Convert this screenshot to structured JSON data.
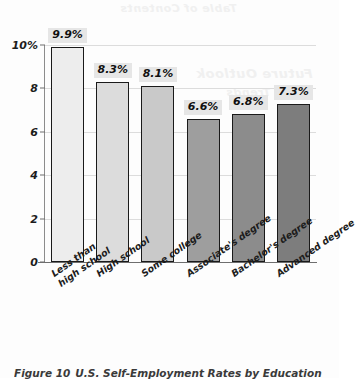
{
  "figure": {
    "caption_label": "Figure 10",
    "caption_text": "U.S. Self-Employment Rates by Education",
    "bleed_through_top": "Table of Contents",
    "bleed_through_mid": "Future Outlook",
    "bleed_through_mid2": "and Trends"
  },
  "chart_data": {
    "type": "bar",
    "title": "",
    "xlabel": "",
    "ylabel": "",
    "categories": [
      "Less than\nhigh school",
      "High school",
      "Some college",
      "Associate's degree",
      "Bachelor's degree",
      "Advanced degree"
    ],
    "values": [
      9.9,
      8.3,
      8.1,
      6.6,
      6.8,
      7.3
    ],
    "value_labels": [
      "9.9%",
      "8.3%",
      "8.1%",
      "6.6%",
      "6.8%",
      "7.3%"
    ],
    "bar_colors": [
      "#ededed",
      "#dcdcdc",
      "#c9c9c9",
      "#9e9e9e",
      "#8c8c8c",
      "#7d7d7d"
    ],
    "bar_outline_color": "#1a1a1a",
    "value_label_background": "#e6e6e6",
    "ylim": [
      0,
      10
    ],
    "yticks": [
      0,
      2,
      4,
      6,
      8,
      10
    ],
    "ytick_labels": [
      "0",
      "2",
      "4",
      "6",
      "8",
      "10%"
    ],
    "grid": true,
    "gridline_color": "#dcdcdc",
    "legend": "none"
  }
}
